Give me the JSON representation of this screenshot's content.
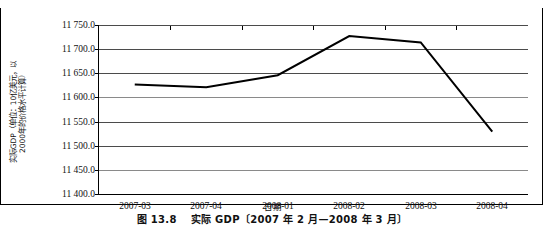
{
  "figure": {
    "caption_number": "图 13.8",
    "caption_text": "实际 GDP〔2007 年 2 月—2008 年 3 月〕"
  },
  "axes": {
    "y_title_line1": "实际GDP（单位：10亿美元，以",
    "y_title_line2": "2000年的价格水平计算）",
    "x_title": "日期"
  },
  "chart_data": {
    "type": "line",
    "title": "实际 GDP〔2007 年 2 月—2008 年 3 月〕",
    "xlabel": "日期",
    "ylabel": "实际GDP（单位：10亿美元，以2000年的价格水平计算）",
    "categories": [
      "2007-03",
      "2007-04",
      "2008-01",
      "2008-02",
      "2008-03",
      "2008-04"
    ],
    "values": [
      11627.0,
      11621.0,
      11646.0,
      11727.0,
      11714.0,
      11529.0
    ],
    "series": [
      {
        "name": "实际GDP",
        "values": [
          11627.0,
          11621.0,
          11646.0,
          11727.0,
          11714.0,
          11529.0
        ],
        "color": "#000000"
      }
    ],
    "ylim": [
      11400.0,
      11750.0
    ],
    "ytick_labels": [
      "11 750.0",
      "11 700.0",
      "11 650.0",
      "11 600.0",
      "11 550.0",
      "11 500.0",
      "11 450.0",
      "11 400.0"
    ],
    "ytick_values": [
      11750.0,
      11700.0,
      11650.0,
      11600.0,
      11550.0,
      11500.0,
      11450.0,
      11400.0
    ],
    "grid": true,
    "legend": false,
    "line_color": "#000000",
    "grid_color": "#4b4b4b"
  }
}
